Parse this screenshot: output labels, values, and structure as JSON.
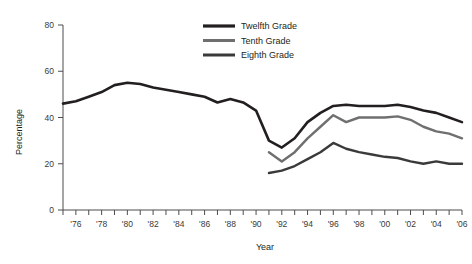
{
  "chart_data": {
    "type": "line",
    "title": "",
    "xlabel": "Year",
    "ylabel": "Percentage",
    "ylim": [
      0,
      80
    ],
    "yticks": [
      0,
      20,
      40,
      60,
      80
    ],
    "ytick_labels": [
      "0",
      "20",
      "40",
      "60",
      "80"
    ],
    "xlim": [
      1975,
      2006
    ],
    "xticks": [
      1975,
      1976,
      1977,
      1978,
      1979,
      1980,
      1981,
      1982,
      1983,
      1984,
      1985,
      1986,
      1987,
      1988,
      1989,
      1990,
      1991,
      1992,
      1993,
      1994,
      1995,
      1996,
      1997,
      1998,
      1999,
      2000,
      2001,
      2002,
      2003,
      2004,
      2005,
      2006
    ],
    "xtick_labels": [
      "'76",
      "'78",
      "'80",
      "'82",
      "'84",
      "'86",
      "'88",
      "'90",
      "'92",
      "'94",
      "'96",
      "'98",
      "'00",
      "'02",
      "'04",
      "'06"
    ],
    "xtick_label_years": [
      1976,
      1978,
      1980,
      1982,
      1984,
      1986,
      1988,
      1990,
      1992,
      1994,
      1996,
      1998,
      2000,
      2002,
      2004,
      2006
    ],
    "grid": false,
    "legend_position": "top-center",
    "series": [
      {
        "name": "Twelfth Grade",
        "color": "#231f20",
        "width": 2.6,
        "x": [
          1975,
          1976,
          1977,
          1978,
          1979,
          1980,
          1981,
          1982,
          1983,
          1984,
          1985,
          1986,
          1987,
          1988,
          1989,
          1990,
          1991,
          1992,
          1993,
          1994,
          1995,
          1996,
          1997,
          1998,
          1999,
          2000,
          2001,
          2002,
          2003,
          2004,
          2005,
          2006
        ],
        "values": [
          46,
          47,
          49,
          51,
          54,
          55,
          54.5,
          53,
          52,
          51,
          50,
          49,
          46.5,
          48,
          46.5,
          43,
          30,
          27,
          31,
          38,
          42,
          45,
          45.5,
          45,
          45,
          45,
          45.5,
          44.5,
          43,
          42,
          40,
          38
        ]
      },
      {
        "name": "Tenth Grade",
        "color": "#6f6f6f",
        "width": 2.4,
        "x": [
          1991,
          1992,
          1993,
          1994,
          1995,
          1996,
          1997,
          1998,
          1999,
          2000,
          2001,
          2002,
          2003,
          2004,
          2005,
          2006
        ],
        "values": [
          25,
          21,
          25,
          31,
          36,
          41,
          38,
          40,
          40,
          40,
          40.5,
          39,
          36,
          34,
          33,
          31
        ]
      },
      {
        "name": "Eighth Grade",
        "color": "#3a3a3a",
        "width": 2.4,
        "x": [
          1991,
          1992,
          1993,
          1994,
          1995,
          1996,
          1997,
          1998,
          1999,
          2000,
          2001,
          2002,
          2003,
          2004,
          2005,
          2006
        ],
        "values": [
          16,
          17,
          19,
          22,
          25,
          29,
          26.5,
          25,
          24,
          23,
          22.5,
          21,
          20,
          21,
          20,
          20
        ]
      }
    ]
  },
  "legend": {
    "items": [
      {
        "label": "Twelfth Grade"
      },
      {
        "label": "Tenth Grade"
      },
      {
        "label": "Eighth Grade"
      }
    ]
  }
}
